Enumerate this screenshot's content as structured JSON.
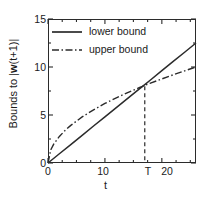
{
  "chart_data": {
    "type": "line",
    "title": "",
    "xlabel": "t",
    "ylabel_prefix": "Bounds to |",
    "ylabel_bold": "w",
    "ylabel_suffix": "(t+1)|",
    "ylabel_full": "Bounds to |w(t+1)|",
    "xlim": [
      0,
      26
    ],
    "ylim": [
      0,
      15
    ],
    "grid": false,
    "legend_position": "top-left",
    "xticks": [
      0,
      10,
      20
    ],
    "xticklabels": [
      "0",
      "10",
      "20"
    ],
    "xtick_minor_step": 2.5,
    "yticks": [
      0,
      5,
      10,
      15
    ],
    "yticklabels": [
      "0",
      "5",
      "10",
      "15"
    ],
    "ytick_minor_step": 2.5,
    "annotations": [
      {
        "name": "T-marker",
        "label": "T",
        "x": 17,
        "y": 8,
        "style": "vertical dashed line from crossing point down to x-axis"
      }
    ],
    "series": [
      {
        "name": "lower bound",
        "style": "solid",
        "color": "#2b2b2b",
        "x": [
          0,
          2,
          4,
          6,
          8,
          10,
          12,
          14,
          16,
          17,
          18,
          20,
          22,
          24,
          26
        ],
        "values": [
          0,
          0.96,
          1.92,
          2.88,
          3.85,
          4.81,
          5.77,
          6.73,
          7.69,
          8.17,
          8.65,
          9.62,
          10.58,
          11.54,
          12.5
        ]
      },
      {
        "name": "upper bound",
        "style": "dash-dot",
        "color": "#2b2b2b",
        "x": [
          0,
          0.5,
          1,
          2,
          3,
          4,
          6,
          8,
          10,
          12,
          14,
          16,
          17,
          18,
          20,
          22,
          24,
          26
        ],
        "values": [
          0,
          1.39,
          1.96,
          2.77,
          3.39,
          3.92,
          4.8,
          5.54,
          6.2,
          6.79,
          7.33,
          7.84,
          8.08,
          8.31,
          8.76,
          9.19,
          9.6,
          10.0
        ]
      }
    ]
  },
  "legend": {
    "items": [
      {
        "label": "lower bound",
        "style": "solid"
      },
      {
        "label": "upper bound",
        "style": "dash-dot"
      }
    ]
  }
}
